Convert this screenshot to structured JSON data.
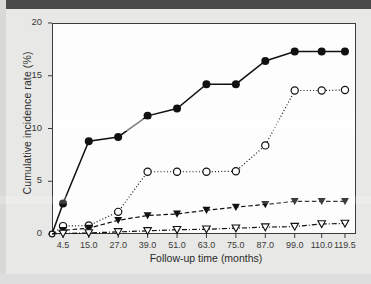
{
  "chart_data": {
    "type": "line",
    "title": "",
    "xlabel": "Follow-up time (months)",
    "ylabel": "Cumulative incidence rate (%)",
    "x_tick_labels": [
      "4.5",
      "15.0",
      "27.0",
      "39.0",
      "51.0",
      "63.0",
      "75.0",
      "87.0",
      "99.0",
      "110.0",
      "119.5"
    ],
    "x_values": [
      4.5,
      15.0,
      27.0,
      39.0,
      51.0,
      63.0,
      75.0,
      87.0,
      99.0,
      110.0,
      119.5
    ],
    "y_tick_labels": [
      "0",
      "5",
      "10",
      "15",
      "20"
    ],
    "y_ticks": [
      0,
      5,
      10,
      15,
      20
    ],
    "ylim": [
      0,
      20
    ],
    "xlim": [
      0,
      124
    ],
    "grid": false,
    "legend": "none",
    "series": [
      {
        "name": "filled-circle-solid",
        "marker": "filled-circle",
        "linestyle": "solid",
        "color": "#111111",
        "x": [
          0,
          4.5,
          15.0,
          27.0,
          39.0,
          51.0,
          63.0,
          75.0,
          87.0,
          99.0,
          110.0,
          119.5
        ],
        "values": [
          0.0,
          2.9,
          8.8,
          9.2,
          11.2,
          11.9,
          14.2,
          14.2,
          16.4,
          17.3,
          17.3,
          17.3
        ]
      },
      {
        "name": "open-circle-dotted",
        "marker": "open-circle",
        "linestyle": "dotted",
        "color": "#111111",
        "x": [
          0,
          4.5,
          15.0,
          27.0,
          39.0,
          51.0,
          63.0,
          75.0,
          87.0,
          99.0,
          110.0,
          119.5
        ],
        "values": [
          0.0,
          0.75,
          0.8,
          2.1,
          5.9,
          5.9,
          5.9,
          5.95,
          8.4,
          13.6,
          13.6,
          13.65
        ]
      },
      {
        "name": "filled-triangle-dashed",
        "marker": "filled-triangle-down",
        "linestyle": "dashed",
        "color": "#111111",
        "x": [
          0,
          4.5,
          15.0,
          27.0,
          39.0,
          51.0,
          63.0,
          75.0,
          87.0,
          99.0,
          110.0,
          119.5
        ],
        "values": [
          0.0,
          0.35,
          0.55,
          1.3,
          1.75,
          1.9,
          2.25,
          2.55,
          2.8,
          3.1,
          3.1,
          3.1
        ]
      },
      {
        "name": "open-triangle-dashdot",
        "marker": "open-triangle-down",
        "linestyle": "dashdot",
        "color": "#111111",
        "x": [
          0,
          4.5,
          15.0,
          27.0,
          39.0,
          51.0,
          63.0,
          75.0,
          87.0,
          99.0,
          110.0,
          119.5
        ],
        "values": [
          0.0,
          0.05,
          0.1,
          0.2,
          0.3,
          0.4,
          0.45,
          0.55,
          0.65,
          0.7,
          0.95,
          1.0
        ]
      }
    ]
  },
  "axes": {
    "y_title": "Cumulative incidence rate (%)",
    "x_title": "Follow-up time (months)"
  }
}
